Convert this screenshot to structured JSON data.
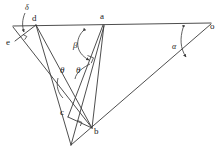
{
  "figure": {
    "type": "geometry-diagram",
    "background_color": "#ffffff",
    "stroke_color": "#3a3a3a",
    "text_color": "#1a1a1a",
    "width": 221,
    "height": 150
  },
  "vertices": [
    {
      "id": "d",
      "label": "d",
      "x": 36,
      "y": 25,
      "label_x": 32,
      "label_y": 17
    },
    {
      "id": "a",
      "label": "a",
      "x": 104,
      "y": 25,
      "label_x": 101,
      "label_y": 15
    },
    {
      "id": "o",
      "label": "o",
      "x": 211,
      "y": 24,
      "label_x": 210,
      "label_y": 24
    },
    {
      "id": "e",
      "label": "e",
      "x": 15,
      "y": 40,
      "label_x": 8,
      "label_y": 41
    },
    {
      "id": "c",
      "label": "c",
      "x": 68,
      "y": 117,
      "label_x": 62,
      "label_y": 110
    },
    {
      "id": "b",
      "label": "b",
      "x": 92,
      "y": 128,
      "label_x": 93,
      "label_y": 129
    },
    {
      "id": "p",
      "label": "",
      "x": 71,
      "y": 145,
      "label_x": 0,
      "label_y": 0
    }
  ],
  "angle_labels": [
    {
      "id": "delta",
      "symbol": "δ",
      "x": 27,
      "y": 8,
      "size": "small"
    },
    {
      "id": "beta",
      "symbol": "β",
      "x": 76,
      "y": 43,
      "size": "normal"
    },
    {
      "id": "alpha",
      "symbol": "α",
      "x": 174,
      "y": 45,
      "size": "small"
    },
    {
      "id": "theta1",
      "symbol": "θ",
      "x": 62,
      "y": 69,
      "size": "normal"
    },
    {
      "id": "theta2",
      "symbol": "θ",
      "x": 78,
      "y": 69,
      "size": "normal"
    }
  ],
  "segments": [
    {
      "id": "top-baseline-e-o",
      "from": "e",
      "to": "o",
      "note": "long top line through d and a"
    },
    {
      "id": "e-to-b",
      "from": "e",
      "to": "b"
    },
    {
      "id": "d-to-p",
      "from": "d",
      "to": "p"
    },
    {
      "id": "d-to-b",
      "from": "d",
      "to": "b"
    },
    {
      "id": "a-to-b",
      "from": "a",
      "to": "b"
    },
    {
      "id": "a-to-c",
      "from": "a",
      "to": "c"
    },
    {
      "id": "a-to-p",
      "from": "a",
      "to": "p"
    },
    {
      "id": "o-to-p",
      "from": "o",
      "to": "p"
    },
    {
      "id": "c-to-b",
      "from": "c",
      "to": "b"
    },
    {
      "id": "e-to-d",
      "from": "e",
      "to": "d"
    }
  ],
  "right_angle_marks": [
    {
      "id": "right-angle-at-ac",
      "x": 91,
      "y": 59
    },
    {
      "id": "right-angle-at-b",
      "x": 79,
      "y": 123
    },
    {
      "id": "right-angle-at-e",
      "x": 25,
      "y": 37
    }
  ],
  "angle_arcs": [
    {
      "id": "delta-arc",
      "note": "small arc at vertex d between baseline and d-e"
    },
    {
      "id": "beta-arc",
      "note": "double-arrow arc from baseline at a to segment a-b"
    },
    {
      "id": "alpha-arc",
      "note": "double-arrow arc from baseline to segment o-b"
    },
    {
      "id": "theta1-arc",
      "note": "arc between e-b and d-b near the theta-1 label"
    },
    {
      "id": "theta2-arc",
      "note": "arc between a-c and a-b near the theta-2 label"
    }
  ]
}
